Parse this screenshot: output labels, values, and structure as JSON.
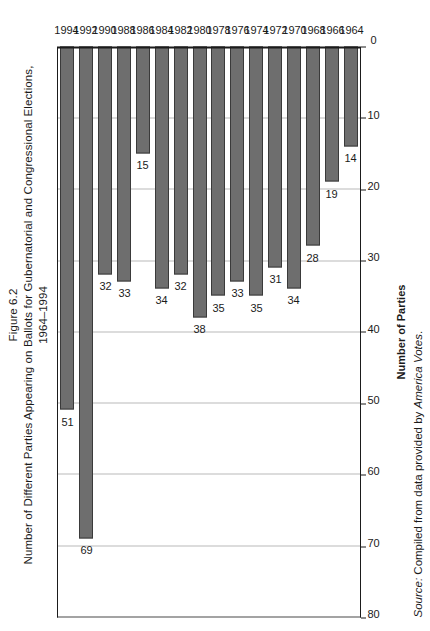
{
  "figure": {
    "number": "Figure 6.2",
    "title": "Number of Different Parties Appearing on Ballots for Gubernatorial and Congressional Elections,",
    "years_line": "1964–1994"
  },
  "source": {
    "label": "Source:",
    "text": " Compiled from data provided by ",
    "publication": "America Votes",
    "period": "."
  },
  "colors": {
    "bar_fill": "#6e6e6e",
    "bar_stroke": "#3a3a3a",
    "axis": "#1b1b1b",
    "gridline": "#b9b9b9",
    "background": "#ffffff"
  },
  "chart_data": {
    "type": "bar",
    "orientation": "horizontal",
    "title": "Number of Different Parties Appearing on Ballots for Gubernatorial and Congressional Elections, 1964–1994",
    "xlabel": "Number of Parties",
    "ylabel": "",
    "xlim": [
      0,
      80
    ],
    "xticks": [
      0,
      10,
      20,
      30,
      40,
      50,
      60,
      70,
      80
    ],
    "grid": true,
    "legend": false,
    "data_labels": true,
    "categories": [
      "1964",
      "1966",
      "1968",
      "1970",
      "1972",
      "1974",
      "1976",
      "1978",
      "1980",
      "1982",
      "1984",
      "1986",
      "1988",
      "1990",
      "1992",
      "1994"
    ],
    "values": [
      14,
      19,
      28,
      34,
      31,
      35,
      33,
      35,
      38,
      32,
      34,
      15,
      33,
      32,
      69,
      51
    ],
    "points": [
      {
        "category": "1964",
        "value": 14
      },
      {
        "category": "1966",
        "value": 19
      },
      {
        "category": "1968",
        "value": 28
      },
      {
        "category": "1970",
        "value": 34
      },
      {
        "category": "1972",
        "value": 31
      },
      {
        "category": "1974",
        "value": 35
      },
      {
        "category": "1976",
        "value": 33
      },
      {
        "category": "1978",
        "value": 35
      },
      {
        "category": "1980",
        "value": 38
      },
      {
        "category": "1982",
        "value": 32
      },
      {
        "category": "1984",
        "value": 34
      },
      {
        "category": "1986",
        "value": 15
      },
      {
        "category": "1988",
        "value": 33
      },
      {
        "category": "1990",
        "value": 32
      },
      {
        "category": "1992",
        "value": 69
      },
      {
        "category": "1994",
        "value": 51
      }
    ]
  }
}
